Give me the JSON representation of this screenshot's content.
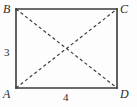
{
  "figure": {
    "kind": "rectangle-with-diagonals",
    "background_color": "#fdfdfd",
    "stroke_color": "#3a3a3a",
    "diagonal_color": "#3f3f3f",
    "text_color": "#2b2b2b",
    "vertices": [
      {
        "id": "B",
        "label": "B",
        "position": "top-left",
        "x": 16,
        "y": 9
      },
      {
        "id": "C",
        "label": "C",
        "position": "top-right",
        "x": 117,
        "y": 9
      },
      {
        "id": "A",
        "label": "A",
        "position": "bottom-left",
        "x": 16,
        "y": 88
      },
      {
        "id": "D",
        "label": "D",
        "position": "bottom-right",
        "x": 117,
        "y": 88
      }
    ],
    "sides": [
      {
        "id": "left",
        "from": "B",
        "to": "A",
        "label": "3",
        "label_position": "outside-left",
        "style": "solid"
      },
      {
        "id": "bottom",
        "from": "A",
        "to": "D",
        "label": "4",
        "label_position": "outside-bottom",
        "style": "solid"
      },
      {
        "id": "top",
        "from": "B",
        "to": "C",
        "label": "",
        "label_position": "none",
        "style": "solid"
      },
      {
        "id": "right",
        "from": "C",
        "to": "D",
        "label": "",
        "label_position": "none",
        "style": "solid"
      }
    ],
    "diagonals": [
      {
        "id": "BD",
        "from": "B",
        "to": "D",
        "style": "dashed"
      },
      {
        "id": "AC",
        "from": "A",
        "to": "C",
        "style": "dashed"
      }
    ],
    "intersection": {
      "x": 67,
      "y": 49
    },
    "measurements": {
      "height_label": "3",
      "width_label": "4"
    }
  }
}
